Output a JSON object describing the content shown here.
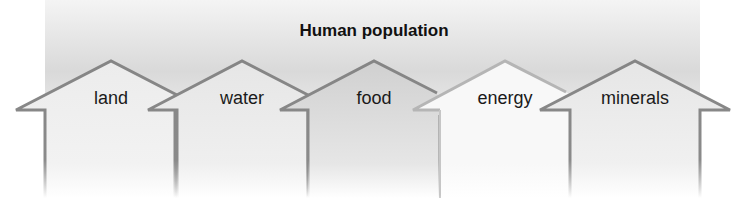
{
  "diagram": {
    "title": "Human population",
    "arrows": [
      {
        "label": "land",
        "fill": "#e9e9e9"
      },
      {
        "label": "water",
        "fill": "#e6e6e6"
      },
      {
        "label": "food",
        "fill": "#d4d4d4"
      },
      {
        "label": "energy",
        "fill": "#f7f7f7"
      },
      {
        "label": "minerals",
        "fill": "#e4e4e4"
      }
    ],
    "stroke_color": "#858585"
  }
}
